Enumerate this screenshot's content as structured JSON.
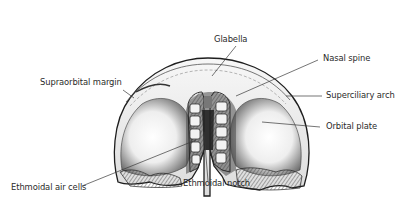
{
  "diagram": {
    "colors": {
      "background": "#ffffff",
      "ink": "#2a2a2a",
      "bone_light": "#f4f4f4",
      "bone_shade": "#8a8a8a",
      "bone_dark": "#2e2e2e"
    },
    "labels": [
      {
        "id": "glabella",
        "text": "Glabella"
      },
      {
        "id": "nasal-spine",
        "text": "Nasal spine"
      },
      {
        "id": "supraorbital-margin",
        "text": "Supraorbital margin"
      },
      {
        "id": "superciliary-arch",
        "text": "Superciliary arch"
      },
      {
        "id": "orbital-plate",
        "text": "Orbital plate"
      },
      {
        "id": "ethmoidal-air-cells",
        "text": "Ethmoidal air cells"
      },
      {
        "id": "ethmoidal-notch",
        "text": "Ethmoidal notch"
      }
    ]
  }
}
